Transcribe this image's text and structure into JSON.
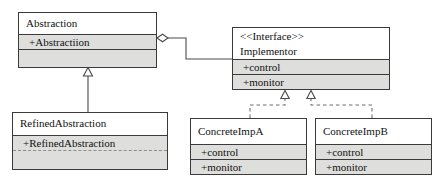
{
  "diagram": {
    "type": "uml-class-diagram",
    "colors": {
      "box_border": "#3a3a3a",
      "header_fill": "#ffffff",
      "members_fill": "#dededc",
      "edge_stroke": "#4a4a4a",
      "page_background": "#ffffff"
    },
    "classes": [
      {
        "id": "abstraction",
        "stereotype": "",
        "name": "Abstraction",
        "members": [
          "+Abstractiion"
        ]
      },
      {
        "id": "implementor",
        "stereotype": "<<Interface>>",
        "name": "Implementor",
        "members": [
          "+control",
          "+monitor"
        ]
      },
      {
        "id": "refined-abstraction",
        "stereotype": "",
        "name": "RefinedAbstraction",
        "members": [
          "+RefinedAbstraction"
        ]
      },
      {
        "id": "concrete-imp-a",
        "stereotype": "",
        "name": "ConcreteImpA",
        "members": [
          "+control",
          "+monitor"
        ]
      },
      {
        "id": "concrete-imp-b",
        "stereotype": "",
        "name": "ConcreteImpB",
        "members": [
          "+control",
          "+monitor"
        ]
      }
    ],
    "relationships": [
      {
        "id": "abstraction-aggregates-implementor",
        "type": "aggregation",
        "from": "abstraction",
        "to": "implementor",
        "line": "solid",
        "source_marker": "hollow-diamond"
      },
      {
        "id": "refined-extends-abstraction",
        "type": "generalization",
        "from": "refined-abstraction",
        "to": "abstraction",
        "line": "solid",
        "target_marker": "hollow-triangle"
      },
      {
        "id": "impa-realizes-implementor",
        "type": "realization",
        "from": "concrete-imp-a",
        "to": "implementor",
        "line": "dashed",
        "target_marker": "hollow-triangle"
      },
      {
        "id": "impb-realizes-implementor",
        "type": "realization",
        "from": "concrete-imp-b",
        "to": "implementor",
        "line": "dashed",
        "target_marker": "hollow-triangle"
      }
    ]
  }
}
